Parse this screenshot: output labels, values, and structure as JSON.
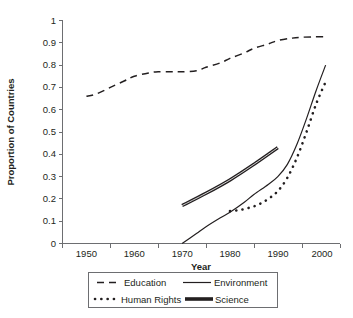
{
  "chart_data": {
    "type": "line",
    "title": "",
    "xlabel": "Year",
    "ylabel": "Proportion of Countries",
    "xlim": [
      1945,
      2003
    ],
    "ylim": [
      0,
      1
    ],
    "grid": false,
    "legend_position": "bottom",
    "x_ticks": [
      "1950",
      "1960",
      "1970",
      "1980",
      "1990",
      "2000"
    ],
    "x_tick_values": [
      1950,
      1960,
      1970,
      1980,
      1990,
      2000
    ],
    "y_ticks": [
      "0",
      "0.1",
      "0.2",
      "0.3",
      "0.4",
      "0.5",
      "0.6",
      "0.7",
      "0.8",
      "0.9",
      "1"
    ],
    "y_tick_values": [
      0,
      0.1,
      0.2,
      0.3,
      0.4,
      0.5,
      0.6,
      0.7,
      0.8,
      0.9,
      1
    ],
    "series": [
      {
        "name": "Education",
        "style": "dashed",
        "x": [
          1950,
          1952,
          1955,
          1958,
          1960,
          1963,
          1965,
          1968,
          1970,
          1973,
          1975,
          1978,
          1980,
          1983,
          1985,
          1988,
          1990,
          1993,
          1995,
          1998,
          2000
        ],
        "values": [
          0.66,
          0.67,
          0.7,
          0.73,
          0.75,
          0.765,
          0.77,
          0.77,
          0.77,
          0.775,
          0.79,
          0.81,
          0.83,
          0.855,
          0.875,
          0.895,
          0.91,
          0.921,
          0.925,
          0.927,
          0.927
        ]
      },
      {
        "name": "Environment",
        "style": "solid-thin",
        "x": [
          1970,
          1973,
          1975,
          1978,
          1980,
          1983,
          1985,
          1988,
          1990,
          1992,
          1994,
          1996,
          1998,
          2000
        ],
        "values": [
          0.0,
          0.045,
          0.075,
          0.115,
          0.14,
          0.185,
          0.22,
          0.265,
          0.3,
          0.355,
          0.445,
          0.56,
          0.685,
          0.8
        ]
      },
      {
        "name": "Human Rights",
        "style": "dotted",
        "x": [
          1980,
          1982,
          1984,
          1986,
          1988,
          1990,
          1992,
          1994,
          1996,
          1998,
          2000
        ],
        "values": [
          0.145,
          0.15,
          0.16,
          0.175,
          0.2,
          0.235,
          0.295,
          0.385,
          0.5,
          0.625,
          0.725
        ]
      },
      {
        "name": "Science",
        "style": "solid-thick",
        "x": [
          1970,
          1975,
          1980,
          1985,
          1990
        ],
        "values": [
          0.17,
          0.225,
          0.285,
          0.355,
          0.43
        ]
      }
    ],
    "legend": [
      {
        "label": "Education",
        "style": "dashed"
      },
      {
        "label": "Environment",
        "style": "solid-thin"
      },
      {
        "label": "Human Rights",
        "style": "dotted"
      },
      {
        "label": "Science",
        "style": "solid-thick"
      }
    ],
    "colors": {
      "line": "#231f20",
      "axis": "#6d6e71",
      "background": "#ffffff"
    }
  }
}
